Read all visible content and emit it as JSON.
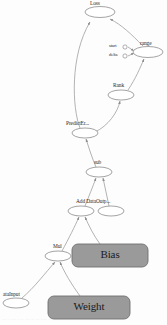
{
  "graph": {
    "title": "Computation Graph",
    "canvas": {
      "width": 167,
      "height": 325
    },
    "colors": {
      "node_fill": "#ffffff",
      "node_stroke": "#8d8d8d",
      "box_fill": "#9a9a9a",
      "box_stroke": "#6f6f6f",
      "edge": "#9a9a9a",
      "text": "#2a2a2a",
      "background": "#fdfdfd"
    },
    "op_nodes": [
      {
        "id": "loss",
        "label": "Loss",
        "shape": "ellipse",
        "cx": 100,
        "cy": 12,
        "rx": 15,
        "ry": 5.5,
        "label_x": 90,
        "label_y": 1
      },
      {
        "id": "range",
        "label": "range",
        "shape": "ellipse",
        "cx": 148,
        "cy": 52,
        "rx": 15,
        "ry": 5.5,
        "label_x": 140,
        "label_y": 41
      },
      {
        "id": "rank",
        "label": "Rank",
        "shape": "ellipse",
        "cx": 121,
        "cy": 95,
        "rx": 13,
        "ry": 5.0,
        "label_x": 113,
        "label_y": 83
      },
      {
        "id": "predicterr",
        "label": "PredictEr...",
        "shape": "ellipse",
        "cx": 85,
        "cy": 133,
        "rx": 13,
        "ry": 5.0,
        "label_x": 66,
        "label_y": 121
      },
      {
        "id": "sub",
        "label": "sub",
        "shape": "ellipse",
        "cx": 99,
        "cy": 172,
        "rx": 13,
        "ry": 5.0,
        "label_x": 94,
        "label_y": 160
      },
      {
        "id": "add",
        "label": "Add DataOutp...",
        "shape": "ellipse",
        "cx": 81,
        "cy": 211,
        "rx": 13,
        "ry": 5.0,
        "label_x": 76,
        "label_y": 199
      },
      {
        "id": "dataoutput",
        "label": "",
        "shape": "ellipse",
        "cx": 111,
        "cy": 211,
        "rx": 13,
        "ry": 5.0,
        "label_x": 0,
        "label_y": 0
      },
      {
        "id": "mul",
        "label": "Mul",
        "shape": "ellipse",
        "cx": 58,
        "cy": 256,
        "rx": 13,
        "ry": 5.0,
        "label_x": 53,
        "label_y": 244
      },
      {
        "id": "datainput",
        "label": "ataInput",
        "shape": "ellipse",
        "cx": 16,
        "cy": 303,
        "rx": 13,
        "ry": 5.0,
        "label_x": 3,
        "label_y": 292
      }
    ],
    "variable_boxes": [
      {
        "id": "bias",
        "label": "Bias",
        "x": 72,
        "y": 244,
        "width": 76,
        "height": 23,
        "radius": 6
      },
      {
        "id": "weight",
        "label": "Weight",
        "x": 48,
        "y": 296,
        "width": 82,
        "height": 23,
        "radius": 6
      }
    ],
    "input_ports": [
      {
        "id": "start",
        "label": "start",
        "cx": 125,
        "cy": 47,
        "r": 2.1,
        "label_x": 109,
        "label_y": 44
      },
      {
        "id": "delta",
        "label": "delta",
        "cx": 125,
        "cy": 56,
        "r": 2.1,
        "label_x": 109,
        "label_y": 53
      }
    ],
    "edges": [
      {
        "id": "e-predicterr-loss",
        "from": "predicterr",
        "to": "loss"
      },
      {
        "id": "e-range-loss",
        "from": "range",
        "to": "loss"
      },
      {
        "id": "e-rank-range",
        "from": "rank",
        "to": "range"
      },
      {
        "id": "e-start-range",
        "from": "start",
        "to": "range"
      },
      {
        "id": "e-delta-range",
        "from": "delta",
        "to": "range"
      },
      {
        "id": "e-predicterr-rank",
        "from": "predicterr",
        "to": "rank"
      },
      {
        "id": "e-sub-predicterr",
        "from": "sub",
        "to": "predicterr"
      },
      {
        "id": "e-add-sub",
        "from": "add",
        "to": "sub"
      },
      {
        "id": "e-dataoutput-sub",
        "from": "dataoutput",
        "to": "sub"
      },
      {
        "id": "e-mul-add",
        "from": "mul",
        "to": "add"
      },
      {
        "id": "e-bias-add",
        "from": "bias",
        "to": "add"
      },
      {
        "id": "e-datainput-mul",
        "from": "datainput",
        "to": "mul"
      },
      {
        "id": "e-weight-mul",
        "from": "weight",
        "to": "mul"
      }
    ],
    "footer_fragment": "···  ·  ··· ·  ·· ··· ··  ·· ···· ·· ·· ··· · ·"
  }
}
